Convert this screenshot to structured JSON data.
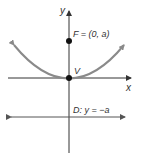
{
  "diagram": {
    "colors": {
      "axis": "#333333",
      "parabola": "#8a8a8a",
      "directrix": "#555555",
      "point": "#111111",
      "text": "#333333"
    },
    "axes": {
      "x_label": "x",
      "y_label": "y"
    },
    "points": [
      {
        "id": "focus",
        "label": "F = (0, a)"
      },
      {
        "id": "vertex",
        "label": "V"
      }
    ],
    "directrix": {
      "label": "D: y = −a"
    },
    "curve": {
      "type": "parabola",
      "equation": "x^2 = 4ay",
      "opens": "up"
    }
  }
}
